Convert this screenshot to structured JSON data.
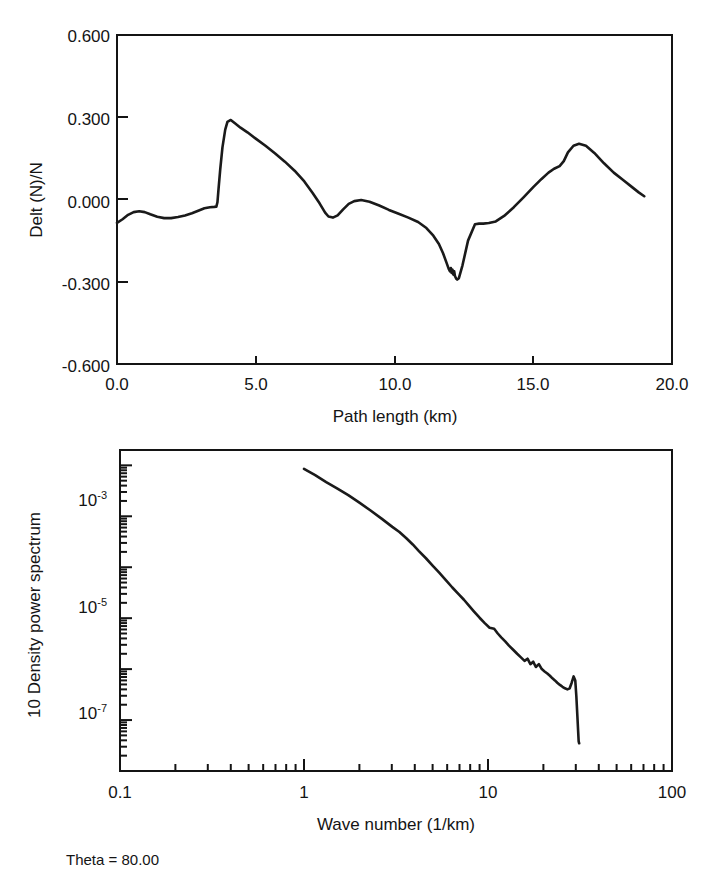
{
  "figure": {
    "annotation": "Theta = 80.00"
  },
  "chart_data": [
    {
      "id": "path-length-profile",
      "type": "line",
      "title": "",
      "xlabel": "Path length (km)",
      "ylabel": "Delt (N)/N",
      "xlim": [
        0.0,
        20.0
      ],
      "ylim": [
        -0.6,
        0.6
      ],
      "xticks": [
        0.0,
        5.0,
        10.0,
        15.0,
        20.0
      ],
      "xticklabels": [
        "0.0",
        "5.0",
        "10.0",
        "15.0",
        "20.0"
      ],
      "yticks": [
        -0.6,
        -0.3,
        0.0,
        0.3,
        0.6
      ],
      "yticklabels": [
        "-0.600",
        "-0.300",
        "0.000",
        "0.300",
        "0.600"
      ],
      "xscale": "linear",
      "yscale": "linear",
      "grid": false,
      "legend": false,
      "series": [
        {
          "name": "Delt (N)/N",
          "x": [
            0.0,
            0.2,
            0.4,
            0.6,
            0.8,
            1.0,
            1.2,
            1.45,
            1.7,
            1.95,
            2.2,
            2.45,
            2.7,
            2.95,
            3.15,
            3.35,
            3.5,
            3.58,
            3.62,
            3.66,
            3.72,
            3.8,
            3.9,
            3.98,
            4.1,
            4.25,
            4.45,
            4.7,
            5.0,
            5.35,
            5.7,
            6.05,
            6.4,
            6.75,
            7.05,
            7.3,
            7.5,
            7.62,
            7.78,
            7.95,
            8.15,
            8.35,
            8.55,
            8.8,
            9.1,
            9.45,
            9.8,
            10.15,
            10.5,
            10.85,
            11.15,
            11.4,
            11.6,
            11.75,
            11.88,
            11.95,
            12.0,
            12.03,
            12.06,
            12.09,
            12.12,
            12.15,
            12.18,
            12.22,
            12.26,
            12.32,
            12.45,
            12.65,
            12.9,
            13.05,
            13.2,
            13.4,
            13.65,
            13.95,
            14.3,
            14.65,
            15.0,
            15.3,
            15.55,
            15.75,
            15.95,
            16.1,
            16.25,
            16.45,
            16.65,
            16.9,
            17.2,
            17.55,
            17.9,
            18.25,
            18.55,
            18.8,
            19.0
          ],
          "y": [
            -0.085,
            -0.072,
            -0.056,
            -0.046,
            -0.043,
            -0.046,
            -0.054,
            -0.063,
            -0.068,
            -0.068,
            -0.064,
            -0.058,
            -0.05,
            -0.04,
            -0.032,
            -0.028,
            -0.027,
            -0.026,
            -0.01,
            0.04,
            0.11,
            0.19,
            0.255,
            0.283,
            0.29,
            0.278,
            0.262,
            0.245,
            0.222,
            0.196,
            0.168,
            0.138,
            0.105,
            0.066,
            0.024,
            -0.014,
            -0.048,
            -0.062,
            -0.066,
            -0.058,
            -0.036,
            -0.016,
            -0.006,
            -0.002,
            -0.008,
            -0.022,
            -0.038,
            -0.052,
            -0.066,
            -0.082,
            -0.104,
            -0.132,
            -0.162,
            -0.196,
            -0.232,
            -0.252,
            -0.262,
            -0.25,
            -0.268,
            -0.256,
            -0.274,
            -0.262,
            -0.28,
            -0.288,
            -0.292,
            -0.287,
            -0.24,
            -0.15,
            -0.09,
            -0.088,
            -0.088,
            -0.086,
            -0.08,
            -0.06,
            -0.028,
            0.008,
            0.045,
            0.075,
            0.098,
            0.112,
            0.122,
            0.14,
            0.172,
            0.196,
            0.203,
            0.196,
            0.17,
            0.132,
            0.098,
            0.07,
            0.046,
            0.026,
            0.012
          ]
        }
      ]
    },
    {
      "id": "density-power-spectrum",
      "type": "line",
      "title": "",
      "xlabel": "Wave number (1/km)",
      "ylabel": "10  Density power spectrum",
      "ylabel_prefix": "10",
      "xlim": [
        0.1,
        100
      ],
      "ylim": [
        1e-08,
        0.02
      ],
      "xscale": "log",
      "yscale": "log",
      "xticks": [
        0.1,
        1,
        10,
        100
      ],
      "xticklabels": [
        "0.1",
        "1",
        "10",
        "100"
      ],
      "yticks": [
        0.001,
        1e-05,
        1e-07
      ],
      "yticklabels": [
        "10-3",
        "10-5",
        "10-7"
      ],
      "ytick_mantissas": [
        "10",
        "10",
        "10"
      ],
      "ytick_exponents": [
        "-3",
        "-5",
        "-7"
      ],
      "grid": false,
      "legend": false,
      "series": [
        {
          "name": "Density power spectrum",
          "x": [
            1.0,
            1.15,
            1.32,
            1.52,
            1.74,
            2.0,
            2.3,
            2.64,
            3.02,
            3.3,
            3.6,
            3.9,
            4.2,
            4.6,
            5.0,
            5.4,
            5.9,
            6.4,
            6.9,
            7.4,
            7.9,
            8.4,
            9.0,
            9.6,
            10.2,
            10.8,
            11.3,
            11.8,
            12.4,
            13.0,
            13.7,
            14.4,
            15.1,
            15.8,
            16.4,
            17.0,
            17.6,
            18.2,
            18.9,
            19.6,
            20.3,
            21.0,
            21.7,
            22.4,
            23.1,
            23.8,
            24.6,
            25.4,
            26.2,
            27.0,
            27.8,
            28.5,
            29.2,
            29.8,
            30.2,
            30.6,
            30.9,
            31.1,
            31.3
          ],
          "y": [
            0.0085,
            0.0064,
            0.0047,
            0.0035,
            0.0026,
            0.00185,
            0.0013,
            0.0009,
            0.00062,
            0.00049,
            0.00037,
            0.00028,
            0.00021,
            0.00015,
            0.000108,
            8e-05,
            5.6e-05,
            4e-05,
            3e-05,
            2.3e-05,
            1.75e-05,
            1.35e-05,
            1.02e-05,
            8e-06,
            6.5e-06,
            6.2e-06,
            5e-06,
            4.2e-06,
            3.5e-06,
            2.9e-06,
            2.4e-06,
            2e-06,
            1.7e-06,
            1.45e-06,
            1.6e-06,
            1.25e-06,
            1.4e-06,
            1.1e-06,
            1.25e-06,
            1e-06,
            9e-07,
            8.2e-07,
            7.4e-07,
            6.6e-07,
            6e-07,
            5.4e-07,
            4.9e-07,
            4.5e-07,
            4.2e-07,
            4e-07,
            4.2e-07,
            5.4e-07,
            7.2e-07,
            6e-07,
            3e-07,
            1.2e-07,
            6e-08,
            3.8e-08,
            3.5e-08
          ]
        }
      ]
    }
  ]
}
